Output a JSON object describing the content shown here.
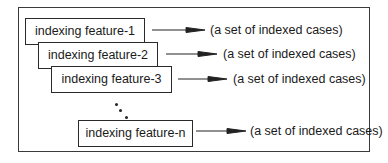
{
  "diagram": {
    "features": [
      {
        "label": "indexing feature-1",
        "target": "(a set of indexed cases)"
      },
      {
        "label": "indexing feature-2",
        "target": "(a set of indexed cases)"
      },
      {
        "label": "indexing feature-3",
        "target": "(a set of indexed cases)"
      },
      {
        "label": "indexing feature-n",
        "target": "(a set of indexed cases)"
      }
    ],
    "ellipsis": "vertical dots between feature-3 and feature-n"
  }
}
